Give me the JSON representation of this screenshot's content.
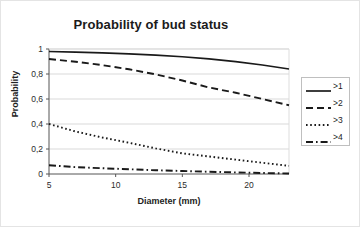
{
  "chart_data": {
    "type": "line",
    "title": "Probability of bud status",
    "xlabel": "Diameter (mm)",
    "ylabel": "Probability",
    "xlim": [
      5,
      23
    ],
    "ylim": [
      0,
      1
    ],
    "grid": "horizontal",
    "legend_position": "right",
    "xticks": [
      5,
      10,
      15,
      20
    ],
    "xtick_labels": [
      "5",
      "10",
      "15",
      "20"
    ],
    "yticks": [
      0,
      0.2,
      0.4,
      0.6,
      0.8,
      1
    ],
    "ytick_labels": [
      "0",
      "0,2",
      "0,4",
      "0,6",
      "0,8",
      "1"
    ],
    "x": [
      5,
      7,
      9,
      11,
      13,
      15,
      17,
      19,
      21,
      23
    ],
    "series": [
      {
        "name": ">1",
        "style": "solid",
        "color": "#1a1a1a",
        "values": [
          0.98,
          0.975,
          0.969,
          0.961,
          0.951,
          0.938,
          0.921,
          0.899,
          0.872,
          0.84
        ]
      },
      {
        "name": ">2",
        "style": "dashed",
        "color": "#1a1a1a",
        "values": [
          0.92,
          0.898,
          0.871,
          0.838,
          0.797,
          0.748,
          0.692,
          0.65,
          0.6,
          0.55
        ]
      },
      {
        "name": ">3",
        "style": "dotted",
        "color": "#1a1a1a",
        "values": [
          0.4,
          0.34,
          0.292,
          0.25,
          0.205,
          0.165,
          0.14,
          0.115,
          0.09,
          0.065
        ]
      },
      {
        "name": ">4",
        "style": "dashdot",
        "color": "#1a1a1a",
        "values": [
          0.07,
          0.055,
          0.046,
          0.038,
          0.03,
          0.024,
          0.018,
          0.013,
          0.008,
          0.004
        ]
      }
    ]
  },
  "legend": {
    "items": [
      {
        "label": ">1"
      },
      {
        "label": ">2"
      },
      {
        "label": ">3"
      },
      {
        "label": ">4"
      }
    ]
  }
}
